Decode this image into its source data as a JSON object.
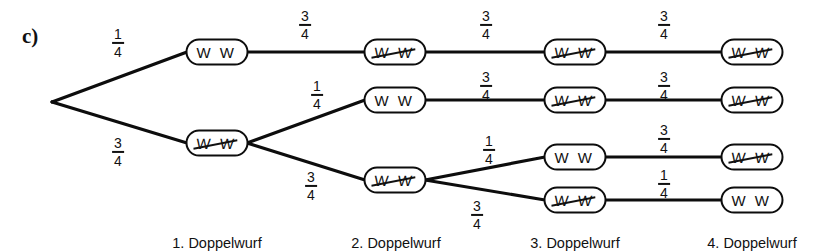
{
  "figure": {
    "part_label": "c)",
    "symbol_plain": "W W",
    "symbol_struck": "W W",
    "stage_captions": [
      "1. Doppelwurf",
      "2. Doppelwurf",
      "3. Doppelwurf",
      "4. Doppelwurf"
    ]
  },
  "chart_data": {
    "type": "tree",
    "title": "c)",
    "stage_labels": [
      "1. Doppelwurf",
      "2. Doppelwurf",
      "3. Doppelwurf",
      "4. Doppelwurf"
    ],
    "node_states": {
      "plain": "W W",
      "struck": "W W (durchgestrichen)"
    },
    "root": {
      "id": "root",
      "x": 52,
      "y": 102
    },
    "nodes": [
      {
        "id": "n1a",
        "stage": 1,
        "label": "W W",
        "struck": false,
        "x": 217,
        "y": 52
      },
      {
        "id": "n1b",
        "stage": 1,
        "label": "W W",
        "struck": true,
        "x": 217,
        "y": 143
      },
      {
        "id": "n2a",
        "stage": 2,
        "label": "W W",
        "struck": true,
        "x": 395,
        "y": 52
      },
      {
        "id": "n2b",
        "stage": 2,
        "label": "W W",
        "struck": false,
        "x": 395,
        "y": 100
      },
      {
        "id": "n2c",
        "stage": 2,
        "label": "W W",
        "struck": true,
        "x": 395,
        "y": 180
      },
      {
        "id": "n3a",
        "stage": 3,
        "label": "W W",
        "struck": true,
        "x": 575,
        "y": 52
      },
      {
        "id": "n3b",
        "stage": 3,
        "label": "W W",
        "struck": true,
        "x": 575,
        "y": 100
      },
      {
        "id": "n3c",
        "stage": 3,
        "label": "W W",
        "struck": false,
        "x": 575,
        "y": 157
      },
      {
        "id": "n3d",
        "stage": 3,
        "label": "W W",
        "struck": true,
        "x": 575,
        "y": 200
      },
      {
        "id": "n4a",
        "stage": 4,
        "label": "W W",
        "struck": true,
        "x": 752,
        "y": 52
      },
      {
        "id": "n4b",
        "stage": 4,
        "label": "W W",
        "struck": true,
        "x": 752,
        "y": 100
      },
      {
        "id": "n4c",
        "stage": 4,
        "label": "W W",
        "struck": true,
        "x": 752,
        "y": 157
      },
      {
        "id": "n4d",
        "stage": 4,
        "label": "W W",
        "struck": false,
        "x": 752,
        "y": 200
      }
    ],
    "edges": [
      {
        "from": "root",
        "to": "n1a",
        "numerator": "1",
        "denominator": "4",
        "value": 0.25,
        "label_x": 118,
        "label_y": 43
      },
      {
        "from": "root",
        "to": "n1b",
        "numerator": "3",
        "denominator": "4",
        "value": 0.75,
        "label_x": 118,
        "label_y": 152
      },
      {
        "from": "n1a",
        "to": "n2a",
        "numerator": "3",
        "denominator": "4",
        "value": 0.75,
        "label_x": 305,
        "label_y": 25
      },
      {
        "from": "n1b",
        "to": "n2b",
        "numerator": "1",
        "denominator": "4",
        "value": 0.25,
        "label_x": 317,
        "label_y": 95
      },
      {
        "from": "n1b",
        "to": "n2c",
        "numerator": "3",
        "denominator": "4",
        "value": 0.75,
        "label_x": 311,
        "label_y": 186
      },
      {
        "from": "n2a",
        "to": "n3a",
        "numerator": "3",
        "denominator": "4",
        "value": 0.75,
        "label_x": 486,
        "label_y": 25
      },
      {
        "from": "n2b",
        "to": "n3b",
        "numerator": "3",
        "denominator": "4",
        "value": 0.75,
        "label_x": 486,
        "label_y": 86
      },
      {
        "from": "n2c",
        "to": "n3c",
        "numerator": "1",
        "denominator": "4",
        "value": 0.25,
        "label_x": 489,
        "label_y": 150
      },
      {
        "from": "n2c",
        "to": "n3d",
        "numerator": "3",
        "denominator": "4",
        "value": 0.75,
        "label_x": 477,
        "label_y": 215
      },
      {
        "from": "n3a",
        "to": "n4a",
        "numerator": "3",
        "denominator": "4",
        "value": 0.75,
        "label_x": 664,
        "label_y": 25
      },
      {
        "from": "n3b",
        "to": "n4b",
        "numerator": "3",
        "denominator": "4",
        "value": 0.75,
        "label_x": 664,
        "label_y": 86
      },
      {
        "from": "n3c",
        "to": "n4c",
        "numerator": "3",
        "denominator": "4",
        "value": 0.75,
        "label_x": 664,
        "label_y": 139
      },
      {
        "from": "n3d",
        "to": "n4d",
        "numerator": "1",
        "denominator": "4",
        "value": 0.25,
        "label_x": 664,
        "label_y": 184
      }
    ],
    "stage_caption_positions": [
      {
        "x": 217,
        "y": 235
      },
      {
        "x": 396,
        "y": 235
      },
      {
        "x": 575,
        "y": 235
      },
      {
        "x": 752,
        "y": 235
      }
    ]
  }
}
